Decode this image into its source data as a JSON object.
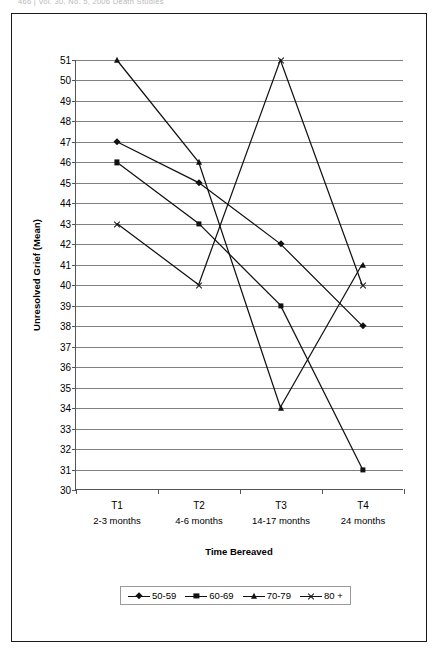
{
  "running_head": "466  |  Vol. 30, No. 5, 2006  Death Studies",
  "chart_data": {
    "type": "line",
    "title": "",
    "xlabel": "Time Bereaved",
    "ylabel": "Unresolved Grief (Mean)",
    "categories": [
      "T1",
      "T2",
      "T3",
      "T4"
    ],
    "category_sublabels": [
      "2-3 months",
      "4-6 months",
      "14-17 months",
      "24 months"
    ],
    "ylim": [
      30,
      51
    ],
    "ytick_labels": [
      "51",
      "50",
      "49",
      "48",
      "47",
      "46",
      "45",
      "44",
      "43",
      "42",
      "41",
      "40",
      "39",
      "38",
      "37",
      "36",
      "35",
      "34",
      "33",
      "32",
      "31",
      "30"
    ],
    "ytick_values": [
      51,
      50,
      49,
      48,
      47,
      46,
      45,
      44,
      43,
      42,
      41,
      40,
      39,
      38,
      37,
      36,
      35,
      34,
      33,
      32,
      31,
      30
    ],
    "grid": true,
    "legend_position": "bottom",
    "series": [
      {
        "name": "50-59",
        "marker": "diamond",
        "values": [
          47,
          45,
          42,
          38
        ]
      },
      {
        "name": "60-69",
        "marker": "square",
        "values": [
          46,
          43,
          39,
          31
        ]
      },
      {
        "name": "70-79",
        "marker": "triangle",
        "values": [
          51,
          46,
          34,
          41
        ]
      },
      {
        "name": "80 +",
        "marker": "x",
        "values": [
          43,
          40,
          51,
          40
        ]
      }
    ]
  }
}
